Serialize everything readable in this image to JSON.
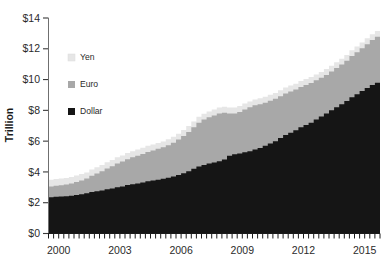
{
  "chart_data": {
    "type": "area",
    "title": "",
    "subtitle": "",
    "xlabel": "",
    "ylabel": "Trillion",
    "stacked": true,
    "grid": false,
    "legend_position": "inside-upper-left",
    "xlim": [
      2000.0,
      2016.25
    ],
    "ylim": [
      0,
      14
    ],
    "ytick_labels": [
      "$0",
      "$2",
      "$4",
      "$6",
      "$8",
      "$10",
      "$12",
      "$14"
    ],
    "ytick_values": [
      0,
      2,
      4,
      6,
      8,
      10,
      12,
      14
    ],
    "xtick_labels": [
      "2000",
      "2003",
      "2006",
      "2009",
      "2012",
      "2015"
    ],
    "xtick_values": [
      2000,
      2003,
      2006,
      2009,
      2012,
      2015
    ],
    "x_minor_tick_interval": 0.25,
    "x": [
      2000.0,
      2000.25,
      2000.5,
      2000.75,
      2001.0,
      2001.25,
      2001.5,
      2001.75,
      2002.0,
      2002.25,
      2002.5,
      2002.75,
      2003.0,
      2003.25,
      2003.5,
      2003.75,
      2004.0,
      2004.25,
      2004.5,
      2004.75,
      2005.0,
      2005.25,
      2005.5,
      2005.75,
      2006.0,
      2006.25,
      2006.5,
      2006.75,
      2007.0,
      2007.25,
      2007.5,
      2007.75,
      2008.0,
      2008.25,
      2008.5,
      2008.75,
      2009.0,
      2009.25,
      2009.5,
      2009.75,
      2010.0,
      2010.25,
      2010.5,
      2010.75,
      2011.0,
      2011.25,
      2011.5,
      2011.75,
      2012.0,
      2012.25,
      2012.5,
      2012.75,
      2013.0,
      2013.25,
      2013.5,
      2013.75,
      2014.0,
      2014.25,
      2014.5,
      2014.75,
      2015.0,
      2015.25,
      2015.5,
      2015.75,
      2016.0
    ],
    "series": [
      {
        "name": "Dollar",
        "color": "#151515",
        "stack_order": 0,
        "values": [
          2.35,
          2.38,
          2.4,
          2.42,
          2.45,
          2.5,
          2.55,
          2.62,
          2.7,
          2.75,
          2.8,
          2.88,
          2.92,
          3.0,
          3.05,
          3.15,
          3.2,
          3.25,
          3.32,
          3.4,
          3.45,
          3.5,
          3.55,
          3.62,
          3.7,
          3.8,
          3.92,
          4.05,
          4.2,
          4.35,
          4.45,
          4.55,
          4.62,
          4.7,
          4.8,
          5.05,
          5.15,
          5.2,
          5.28,
          5.35,
          5.45,
          5.55,
          5.7,
          5.85,
          6.0,
          6.2,
          6.4,
          6.55,
          6.7,
          6.9,
          7.05,
          7.2,
          7.4,
          7.6,
          7.8,
          8.0,
          8.2,
          8.4,
          8.6,
          8.85,
          9.05,
          9.25,
          9.45,
          9.65,
          9.8
        ]
      },
      {
        "name": "Euro",
        "color": "#a8a8a8",
        "stack_order": 1,
        "values": [
          0.7,
          0.72,
          0.74,
          0.76,
          0.8,
          0.85,
          0.9,
          0.95,
          1.05,
          1.15,
          1.25,
          1.35,
          1.45,
          1.55,
          1.62,
          1.68,
          1.75,
          1.8,
          1.85,
          1.9,
          1.95,
          2.0,
          2.05,
          2.12,
          2.2,
          2.3,
          2.42,
          2.55,
          2.7,
          2.85,
          2.95,
          3.0,
          3.05,
          3.1,
          3.05,
          2.75,
          2.65,
          2.7,
          2.78,
          2.85,
          2.88,
          2.85,
          2.8,
          2.78,
          2.75,
          2.72,
          2.7,
          2.68,
          2.65,
          2.62,
          2.6,
          2.58,
          2.55,
          2.52,
          2.5,
          2.52,
          2.55,
          2.58,
          2.62,
          2.68,
          2.72,
          2.78,
          2.85,
          2.92,
          2.98
        ]
      },
      {
        "name": "Yen",
        "color": "#e6e6e6",
        "stack_order": 2,
        "values": [
          0.45,
          0.44,
          0.43,
          0.42,
          0.42,
          0.41,
          0.41,
          0.4,
          0.4,
          0.4,
          0.4,
          0.4,
          0.4,
          0.4,
          0.4,
          0.4,
          0.4,
          0.4,
          0.4,
          0.4,
          0.38,
          0.38,
          0.38,
          0.38,
          0.38,
          0.38,
          0.38,
          0.38,
          0.38,
          0.38,
          0.38,
          0.38,
          0.38,
          0.38,
          0.38,
          0.38,
          0.38,
          0.38,
          0.38,
          0.38,
          0.38,
          0.38,
          0.38,
          0.38,
          0.38,
          0.38,
          0.38,
          0.38,
          0.38,
          0.38,
          0.38,
          0.38,
          0.38,
          0.38,
          0.38,
          0.38,
          0.38,
          0.38,
          0.38,
          0.38,
          0.38,
          0.38,
          0.38,
          0.38,
          0.38
        ]
      }
    ],
    "legend": [
      {
        "label": "Yen",
        "color": "#e6e6e6"
      },
      {
        "label": "Euro",
        "color": "#a8a8a8"
      },
      {
        "label": "Dollar",
        "color": "#151515"
      }
    ]
  }
}
